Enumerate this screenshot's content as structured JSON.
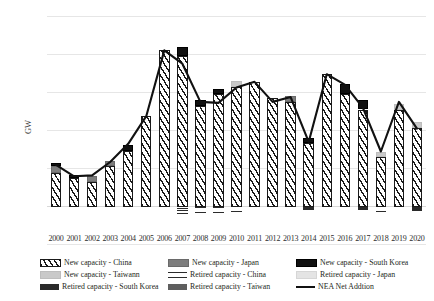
{
  "axis": {
    "ylabel": "GW",
    "yticks": [
      "100",
      "80",
      "60",
      "40",
      "20",
      "0",
      "-20"
    ],
    "xticks": [
      "2000",
      "2001",
      "2002",
      "2003",
      "2004",
      "2005",
      "2006",
      "2007",
      "2008",
      "2009",
      "2010",
      "2011",
      "2012",
      "2013",
      "2014",
      "2015",
      "2016",
      "2017",
      "2018",
      "2019",
      "2020"
    ]
  },
  "legend": {
    "items": [
      {
        "label": "New capacity - China",
        "pattern": "p-china-new"
      },
      {
        "label": "New capacity - Japan",
        "pattern": "p-japan-new"
      },
      {
        "label": "New capacity - South Korea",
        "pattern": "p-skorea-new"
      },
      {
        "label": "New capacity - Taiwann",
        "pattern": "p-taiwan-new"
      },
      {
        "label": "Retired capacity - China",
        "pattern": "p-china-ret"
      },
      {
        "label": "Retired capacity - Japan",
        "pattern": "p-japan-ret"
      },
      {
        "label": "Retired capacity - South Korea",
        "pattern": "p-skorea-ret"
      },
      {
        "label": "Retired capacity - Taiwan",
        "pattern": "p-taiwan-ret"
      },
      {
        "label": "NEA Net Addtion",
        "pattern": "sw-line"
      }
    ]
  },
  "colors": {
    "china_new": "#1a1a1a",
    "japan_new": "#7d7d7d",
    "skorea_new": "#111111",
    "taiwan_new": "#c9c9c9",
    "china_ret": "#2b2b2b",
    "japan_ret": "#e4e4e4",
    "skorea_ret": "#2a2a2a",
    "taiwan_ret": "#5e5e5e",
    "nea_line": "#111111",
    "grid": "#e6e6e6"
  },
  "chart_data": {
    "type": "bar",
    "title": "",
    "xlabel": "",
    "ylabel": "GW",
    "ylim": [
      -20,
      100
    ],
    "grid": true,
    "legend_position": "bottom",
    "categories": [
      "2000",
      "2001",
      "2002",
      "2003",
      "2004",
      "2005",
      "2006",
      "2007",
      "2008",
      "2009",
      "2010",
      "2011",
      "2012",
      "2013",
      "2014",
      "2015",
      "2016",
      "2017",
      "2018",
      "2019",
      "2020"
    ],
    "series": [
      {
        "name": "New capacity - China",
        "values": [
          17.5,
          15.0,
          13.0,
          21.5,
          29.5,
          47.5,
          82.0,
          79.0,
          53.0,
          59.0,
          63.0,
          65.5,
          57.0,
          55.0,
          33.5,
          69.5,
          59.0,
          51.0,
          26.0,
          50.5,
          41.5
        ]
      },
      {
        "name": "New capacity - Japan",
        "values": [
          4.0,
          0.0,
          3.0,
          2.5,
          0.0,
          0.0,
          0.0,
          0.0,
          0.0,
          0.0,
          0.0,
          0.0,
          0.0,
          3.0,
          0.0,
          0.0,
          0.0,
          0.0,
          0.0,
          0.0,
          0.0
        ]
      },
      {
        "name": "New capacity - South Korea",
        "values": [
          1.5,
          1.5,
          0.0,
          0.0,
          3.0,
          0.0,
          0.0,
          5.0,
          3.0,
          3.0,
          0.0,
          0.0,
          0.0,
          0.0,
          2.5,
          0.0,
          5.5,
          5.0,
          0.0,
          0.0,
          0.0
        ]
      },
      {
        "name": "New capacity - Taiwann",
        "values": [
          0.0,
          0.0,
          0.0,
          0.0,
          0.0,
          0.0,
          0.0,
          0.0,
          0.0,
          0.0,
          3.0,
          0.0,
          0.0,
          0.0,
          0.0,
          0.0,
          0.0,
          0.0,
          2.5,
          3.5,
          3.0
        ]
      },
      {
        "name": "Retired capacity - China",
        "values": [
          0.0,
          0.0,
          0.0,
          0.0,
          0.0,
          0.0,
          0.0,
          -3.5,
          -3.0,
          -3.0,
          -2.5,
          0.0,
          0.0,
          0.0,
          0.0,
          0.0,
          0.0,
          0.0,
          -2.5,
          0.0,
          0.0
        ]
      },
      {
        "name": "Retired capacity - Japan",
        "values": [
          0.0,
          0.0,
          0.0,
          0.0,
          0.0,
          0.0,
          0.0,
          0.0,
          0.0,
          0.0,
          0.0,
          0.0,
          0.0,
          0.0,
          0.0,
          0.0,
          0.0,
          0.0,
          0.0,
          0.0,
          0.0
        ]
      },
      {
        "name": "Retired capacity - South Korea",
        "values": [
          0.0,
          0.0,
          0.0,
          0.0,
          0.0,
          0.0,
          0.0,
          0.0,
          0.0,
          0.0,
          0.0,
          0.0,
          0.0,
          0.0,
          -1.5,
          0.0,
          0.0,
          -1.5,
          0.0,
          0.0,
          -2.0
        ]
      },
      {
        "name": "Retired capacity - Taiwan",
        "values": [
          0.0,
          0.0,
          0.0,
          0.0,
          0.0,
          0.0,
          0.0,
          0.0,
          0.0,
          0.0,
          0.0,
          0.0,
          0.0,
          0.0,
          0.0,
          0.0,
          0.0,
          0.0,
          0.0,
          0.0,
          0.0
        ]
      },
      {
        "name": "NEA Net Addtion",
        "type": "line",
        "values": [
          22.0,
          16.0,
          16.5,
          23.5,
          33.0,
          47.5,
          82.0,
          75.0,
          55.0,
          54.5,
          62.5,
          65.5,
          55.0,
          57.5,
          34.0,
          69.5,
          64.0,
          52.0,
          29.0,
          55.0,
          41.0
        ]
      }
    ]
  }
}
